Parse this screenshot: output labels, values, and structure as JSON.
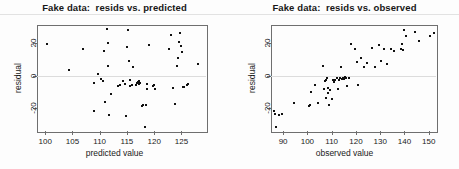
{
  "figure": {
    "background": "#fdfdfd",
    "point_color": "#111111",
    "frame_color": "#6f6f6f",
    "zeroline_color": "#dcdcdc"
  },
  "chart_data": [
    {
      "type": "scatter",
      "title": "Fake data:  resids vs. predicted",
      "xlabel": "predicted value",
      "ylabel": "residual",
      "xlim": [
        98.5,
        129.5
      ],
      "ylim": [
        -34,
        31
      ],
      "xticks": [
        100,
        105,
        110,
        115,
        120,
        125
      ],
      "yticks": [
        -20,
        0,
        20
      ],
      "grid": false,
      "zero_reference_line": 0,
      "legend": null,
      "x": [
        100.4,
        104.3,
        107.0,
        108.9,
        109.0,
        109.6,
        110.3,
        110.6,
        110.8,
        111.0,
        111.3,
        111.5,
        111.6,
        111.7,
        112.1,
        113.3,
        113.8,
        114.3,
        114.6,
        114.9,
        115.0,
        115.2,
        115.4,
        115.5,
        115.6,
        116.0,
        116.2,
        116.6,
        116.9,
        117.0,
        117.1,
        117.2,
        117.3,
        117.4,
        117.8,
        118.0,
        118.3,
        118.5,
        118.6,
        118.7,
        119.0,
        119.7,
        120.0,
        120.2,
        122.8,
        123.0,
        123.4,
        123.8,
        124.2,
        124.4,
        124.6,
        124.8,
        125.0,
        125.1,
        125.2,
        125.4,
        126.0,
        126.2,
        128.0
      ],
      "y": [
        19.6,
        3.4,
        16.3,
        -4.6,
        -21.5,
        0.8,
        -2.4,
        -3.1,
        14.8,
        -16.5,
        28.5,
        20.0,
        5.6,
        -24.0,
        -11.5,
        -6.5,
        -5.8,
        -3.5,
        -5.0,
        -25.0,
        17.5,
        28.2,
        8.8,
        -6.2,
        -2.6,
        -5.5,
        5.0,
        -6.0,
        -4.8,
        -4.4,
        -4.0,
        -3.6,
        -5.2,
        -4.6,
        -18.5,
        -17.8,
        -31.5,
        -18.2,
        -5.0,
        -8.5,
        18.8,
        -6.2,
        -5.5,
        -8.0,
        16.0,
        24.6,
        -7.8,
        -17.5,
        5.6,
        11.0,
        20.5,
        25.8,
        18.0,
        14.2,
        -7.2,
        -7.0,
        -5.5,
        -5.2,
        6.8
      ]
    },
    {
      "type": "scatter",
      "title": "Fake data:  resids vs. observed",
      "xlabel": "observed value",
      "ylabel": "residual",
      "xlim": [
        85,
        153
      ],
      "ylim": [
        -34,
        31
      ],
      "xticks": [
        90,
        100,
        110,
        120,
        130,
        140,
        150
      ],
      "yticks": [
        -20,
        0,
        20
      ],
      "grid": false,
      "zero_reference_line": 0,
      "legend": null,
      "x": [
        86.3,
        86.6,
        87.0,
        88.2,
        89.5,
        94.5,
        100.5,
        101.0,
        101.6,
        103.0,
        104.2,
        106.5,
        107.0,
        107.2,
        107.5,
        107.8,
        108.0,
        108.3,
        108.6,
        109.0,
        109.4,
        110.0,
        110.5,
        111.0,
        111.5,
        112.0,
        112.5,
        113.0,
        113.4,
        113.8,
        114.2,
        114.6,
        115.0,
        115.4,
        116.0,
        116.4,
        117.0,
        118.0,
        119.5,
        120.5,
        121.0,
        122.0,
        123.5,
        124.5,
        126.5,
        128.0,
        129.5,
        130.5,
        131.5,
        133.0,
        134.5,
        135.5,
        138.5,
        139.0,
        139.5,
        140.0,
        140.5,
        144.5,
        146.0,
        150.5,
        152.0
      ],
      "y": [
        -22.0,
        -23.5,
        -31.5,
        -24.0,
        -23.5,
        -17.0,
        -18.5,
        -18.2,
        -10.0,
        -5.5,
        -17.0,
        6.0,
        -8.5,
        -3.5,
        -2.5,
        -13.5,
        -1.8,
        -7.5,
        -10.5,
        -18.0,
        -9.0,
        -14.5,
        -3.0,
        -4.0,
        -2.5,
        -1.5,
        -8.0,
        -2.5,
        -1.8,
        5.5,
        -2.0,
        -1.5,
        -2.2,
        -1.0,
        -1.5,
        -6.5,
        -1.2,
        19.5,
        16.0,
        8.5,
        -5.5,
        11.0,
        5.0,
        8.0,
        17.0,
        5.5,
        18.5,
        9.0,
        16.5,
        7.0,
        16.5,
        15.0,
        16.0,
        19.5,
        15.5,
        28.0,
        24.5,
        26.5,
        21.0,
        24.5,
        26.0
      ]
    }
  ]
}
